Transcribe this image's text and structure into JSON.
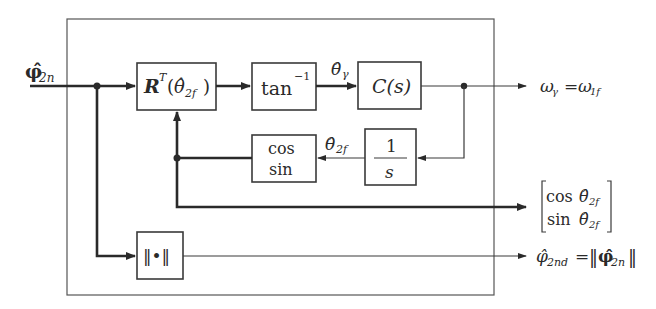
{
  "diagram": {
    "type": "control-block-diagram",
    "input": {
      "symbol": "φ̂",
      "subscript": "2n",
      "description": "phi-hat 2n (bold vector)"
    },
    "blocks": [
      {
        "id": "rotation",
        "main": "R",
        "sup": "T",
        "arg_open": "(",
        "arg": "θ̂",
        "arg_sub": "2f",
        "arg_close": ")"
      },
      {
        "id": "arctan",
        "main": "tan",
        "sup": "−1"
      },
      {
        "id": "controller",
        "main": "C(s)"
      },
      {
        "id": "integrator",
        "numerator": "1",
        "denominator": "s"
      },
      {
        "id": "trig",
        "line1": "cos",
        "line2": "sin"
      },
      {
        "id": "norm",
        "main": "‖•‖"
      }
    ],
    "signals": {
      "theta_gamma": {
        "symbol": "θ̂",
        "subscript": "γ"
      },
      "theta_2f": {
        "symbol": "θ̂",
        "subscript": "2f"
      }
    },
    "outputs": [
      {
        "id": "omega",
        "lhs": "ω",
        "lhs_sub": "γ",
        "eq": "=",
        "rhs": "ω",
        "rhs_sub": "1f"
      },
      {
        "id": "cos_sin_vector",
        "row1_fn": "cos",
        "row1_sym": "θ̂",
        "row1_sub": "2f",
        "row2_fn": "sin",
        "row2_sym": "θ̂",
        "row2_sub": "2f"
      },
      {
        "id": "phi_2nd",
        "lhs": "φ̂",
        "lhs_sub": "2nd",
        "eq": "=",
        "norm_open": "‖",
        "rhs": "φ̂",
        "rhs_sub": "2n",
        "norm_close": "‖"
      }
    ]
  }
}
